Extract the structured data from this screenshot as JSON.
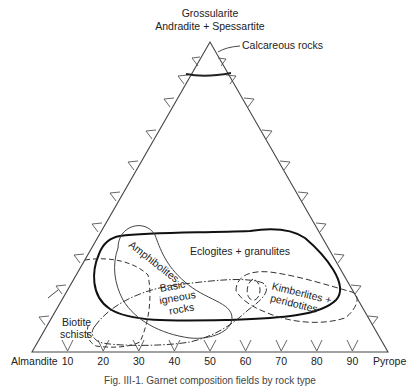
{
  "diagram": {
    "type": "ternary",
    "apex_label_line1": "Grossularite",
    "apex_label_line2": "Andradite + Spessartite",
    "left_vertex_label": "Almandite",
    "right_vertex_label": "Pyrope",
    "base_ticks": [
      "10",
      "20",
      "30",
      "40",
      "50",
      "60",
      "70",
      "80",
      "90"
    ],
    "fields": {
      "calcareous": "Calcareous rocks",
      "amphibolites": "Amphibolites",
      "eclogites": "Eclogites + granulites",
      "basic_igneous_1": "Basic",
      "basic_igneous_2": "igneous",
      "basic_igneous_3": "rocks",
      "kimberlites_1": "Kimberlites +",
      "kimberlites_2": "peridotites",
      "biotite_1": "Biotite",
      "biotite_2": "schists"
    },
    "caption": "Fig. III-1. Garnet composition fields by rock type"
  }
}
